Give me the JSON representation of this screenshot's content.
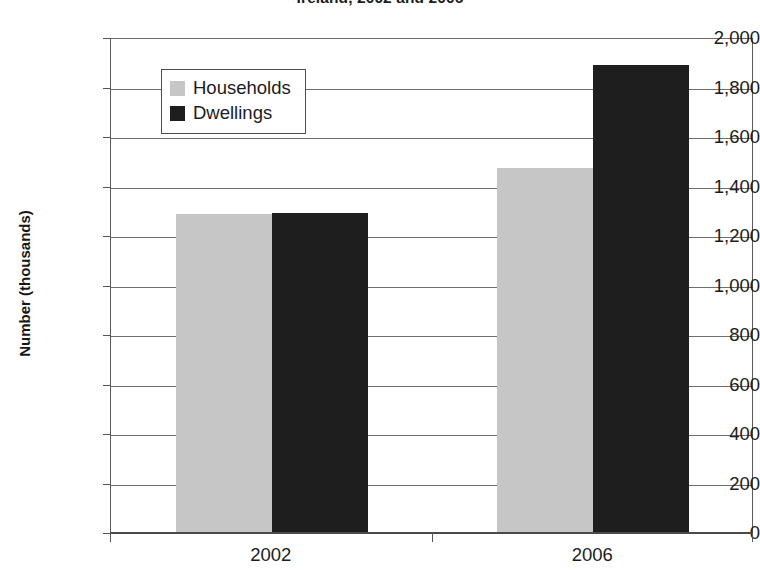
{
  "chart_data": {
    "type": "bar",
    "title": "Ireland, 2002 and 2006",
    "xlabel": "",
    "ylabel": "Number (thousands)",
    "categories": [
      "2002",
      "2006"
    ],
    "series": [
      {
        "name": "Households",
        "values": [
          1285,
          1469
        ],
        "color": "#c6c6c6"
      },
      {
        "name": "Dwellings",
        "values": [
          1290,
          1885
        ],
        "color": "#1e1e1e"
      }
    ],
    "ylim": [
      0,
      2000
    ],
    "ytick_step": 200,
    "ytick_labels": [
      "2,000",
      "1,800",
      "1,600",
      "1,400",
      "1,200",
      "1,000",
      "800",
      "600",
      "400",
      "200",
      "0"
    ],
    "ytick_values": [
      2000,
      1800,
      1600,
      1400,
      1200,
      1000,
      800,
      600,
      400,
      200,
      0
    ],
    "grid": true,
    "legend_position": "upper-left-inside",
    "legend_entries": [
      "Households",
      "Dwellings"
    ]
  }
}
